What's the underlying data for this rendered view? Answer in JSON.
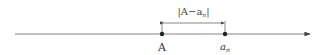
{
  "diagram": {
    "type": "number-line",
    "distance_label": "|A−a",
    "distance_label_sub": "n",
    "distance_label_end": "|",
    "points": [
      {
        "label": "A",
        "sub": ""
      },
      {
        "label": "a",
        "sub": "n"
      }
    ],
    "colors": {
      "line": "#555555",
      "point": "#222222",
      "text": "#333333"
    }
  }
}
